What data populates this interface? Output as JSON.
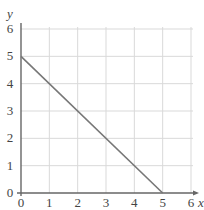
{
  "chart_data": {
    "type": "line",
    "title": "",
    "xlabel": "x",
    "ylabel": "y",
    "xlim": [
      0,
      6
    ],
    "ylim": [
      0,
      6
    ],
    "x_ticks": [
      "0",
      "1",
      "2",
      "3",
      "4",
      "5",
      "6"
    ],
    "y_ticks": [
      "0",
      "1",
      "2",
      "3",
      "4",
      "5",
      "6"
    ],
    "grid": true,
    "legend": null,
    "series": [
      {
        "name": "line",
        "x": [
          0,
          5
        ],
        "y": [
          5,
          0
        ]
      }
    ]
  },
  "colors": {
    "line": "#777777",
    "grid": "#d9d9d9",
    "axis": "#666666",
    "text": "#444444"
  }
}
